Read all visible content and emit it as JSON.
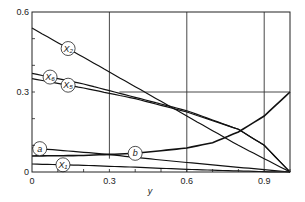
{
  "chart_data": {
    "type": "line",
    "title": "",
    "xlabel": "y",
    "ylabel": "",
    "xlim": [
      0,
      1.0
    ],
    "ylim": [
      0,
      0.6
    ],
    "x_ticks": [
      "0",
      "0.3",
      "0.6",
      "0.9"
    ],
    "x_tick_values": [
      0,
      0.3,
      0.6,
      0.9
    ],
    "y_ticks": [
      "0",
      "0.3",
      "0.6"
    ],
    "y_tick_values": [
      0,
      0.3,
      0.6
    ],
    "grid": "partial",
    "series": [
      {
        "name": "X2",
        "label": "X₂",
        "x": [
          0,
          0.2,
          0.4,
          0.6,
          0.8,
          1.0
        ],
        "y": [
          0.54,
          0.43,
          0.32,
          0.21,
          0.1,
          0.0
        ],
        "label_at": 0.14
      },
      {
        "name": "X6",
        "label": "X₆",
        "x": [
          0,
          0.2,
          0.4,
          0.6,
          0.8,
          0.9,
          1.0
        ],
        "y": [
          0.37,
          0.33,
          0.28,
          0.23,
          0.16,
          0.1,
          0.0
        ],
        "label_at": 0.07
      },
      {
        "name": "X5",
        "label": "X₅",
        "x": [
          0,
          0.2,
          0.4,
          0.6,
          0.8,
          0.9,
          1.0
        ],
        "y": [
          0.35,
          0.315,
          0.275,
          0.225,
          0.16,
          0.1,
          0.0
        ],
        "label_at": 0.14
      },
      {
        "name": "a",
        "label": "a",
        "x": [
          0,
          0.25,
          0.5,
          0.75,
          1.0
        ],
        "y": [
          0.09,
          0.07,
          0.045,
          0.022,
          0.0
        ],
        "label_at": 0.03
      },
      {
        "name": "b",
        "label": "b",
        "x": [
          0,
          0.2,
          0.4,
          0.6,
          0.7,
          0.8,
          0.9,
          1.0
        ],
        "y": [
          0.06,
          0.062,
          0.07,
          0.09,
          0.11,
          0.15,
          0.21,
          0.3
        ],
        "label_at": 0.4
      },
      {
        "name": "X1",
        "label": "X₁",
        "x": [
          0,
          0.2,
          0.4,
          0.6,
          0.8,
          0.95,
          1.0
        ],
        "y": [
          0.03,
          0.025,
          0.018,
          0.01,
          0.004,
          0.0,
          0.0
        ],
        "label_at": 0.12
      }
    ]
  }
}
